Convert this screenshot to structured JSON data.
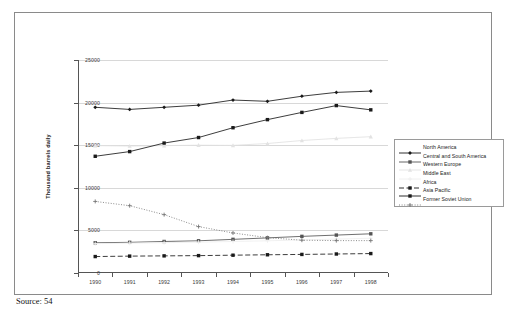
{
  "figure": {
    "source_note": "Source: 54"
  },
  "chart_data": {
    "type": "line",
    "title": "",
    "xlabel": "",
    "ylabel": "Thousand barrels daily",
    "x": [
      1990,
      1991,
      1992,
      1993,
      1994,
      1995,
      1996,
      1997,
      1998
    ],
    "categories": [
      "1990",
      "1991",
      "1992",
      "1993",
      "1994",
      "1995",
      "1996",
      "1997",
      "1998"
    ],
    "ylim": [
      0,
      25000
    ],
    "yticks": [
      0,
      5000,
      10000,
      15000,
      20000,
      25000
    ],
    "ytick_labels": [
      "0",
      "5000",
      "10000",
      "15000",
      "20000",
      "25000"
    ],
    "grid": true,
    "legend_position": "right",
    "series": [
      {
        "name": "North America",
        "values": [
          19450,
          19200,
          19450,
          19700,
          20300,
          20150,
          20750,
          21200,
          21350
        ],
        "color": "#1a1a1a",
        "style": "solid",
        "marker": "diamond"
      },
      {
        "name": "Central and South America",
        "values": [
          3550,
          3600,
          3700,
          3780,
          3950,
          4120,
          4300,
          4450,
          4600
        ],
        "color": "#555555",
        "style": "solid",
        "marker": "square"
      },
      {
        "name": "Western Europe",
        "values": [
          14950,
          14900,
          14950,
          15000,
          14980,
          15200,
          15550,
          15800,
          16000
        ],
        "color": "#e2e2e2",
        "style": "solid",
        "marker": "triangle"
      },
      {
        "name": "Middle East",
        "values": [
          3450,
          3500,
          3560,
          3620,
          3700,
          3780,
          3880,
          3980,
          4080
        ],
        "color": "#eeeeee",
        "style": "solid",
        "marker": "cross"
      },
      {
        "name": "Africa",
        "values": [
          1930,
          1980,
          2010,
          2040,
          2090,
          2140,
          2180,
          2230,
          2280
        ],
        "color": "#1a1a1a",
        "style": "dashed",
        "marker": "square"
      },
      {
        "name": "Asia Pacific",
        "values": [
          13700,
          14250,
          15250,
          15900,
          17050,
          18000,
          18850,
          19650,
          19150
        ],
        "color": "#1a1a1a",
        "style": "solid",
        "marker": "square"
      },
      {
        "name": "Former Soviet Union",
        "values": [
          8400,
          7900,
          6850,
          5450,
          4700,
          4150,
          3850,
          3800,
          3800
        ],
        "color": "#777777",
        "style": "dotted",
        "marker": "cross"
      }
    ]
  }
}
